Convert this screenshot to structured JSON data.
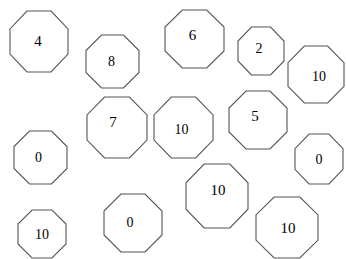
{
  "page": {
    "background_color": "#ffffff",
    "stroke_color": "#555555",
    "text_color": "#000000",
    "width": 346,
    "height": 259,
    "shape_type": "octagon",
    "shape_count": 14
  },
  "shapes": [
    {
      "id": "octagon-4",
      "value": "4",
      "x": 10,
      "y": 11,
      "w": 58,
      "h": 61,
      "font_size": 15,
      "dx": -1,
      "dy": 0
    },
    {
      "id": "octagon-8",
      "value": "8",
      "x": 86,
      "y": 35,
      "w": 53,
      "h": 53,
      "font_size": 14,
      "dx": -1,
      "dy": 0
    },
    {
      "id": "octagon-6",
      "value": "6",
      "x": 165,
      "y": 10,
      "w": 59,
      "h": 58,
      "font_size": 15,
      "dx": -2,
      "dy": -4
    },
    {
      "id": "octagon-2",
      "value": "2",
      "x": 238,
      "y": 27,
      "w": 46,
      "h": 48,
      "font_size": 14,
      "dx": -2,
      "dy": -2
    },
    {
      "id": "octagon-10-topright",
      "value": "10",
      "x": 288,
      "y": 46,
      "w": 56,
      "h": 57,
      "font_size": 14,
      "dx": 3,
      "dy": 2
    },
    {
      "id": "octagon-7",
      "value": "7",
      "x": 87,
      "y": 97,
      "w": 60,
      "h": 61,
      "font_size": 15,
      "dx": -4,
      "dy": -5
    },
    {
      "id": "octagon-10-middle",
      "value": "10",
      "x": 154,
      "y": 97,
      "w": 59,
      "h": 61,
      "font_size": 14,
      "dx": -2,
      "dy": 2
    },
    {
      "id": "octagon-5",
      "value": "5",
      "x": 229,
      "y": 91,
      "w": 58,
      "h": 58,
      "font_size": 15,
      "dx": -3,
      "dy": -4
    },
    {
      "id": "octagon-0-left",
      "value": "0",
      "x": 14,
      "y": 131,
      "w": 53,
      "h": 53,
      "font_size": 14,
      "dx": -2,
      "dy": 0
    },
    {
      "id": "octagon-0-right",
      "value": "0",
      "x": 295,
      "y": 134,
      "w": 48,
      "h": 50,
      "font_size": 14,
      "dx": 0,
      "dy": 1
    },
    {
      "id": "octagon-10-center",
      "value": "10",
      "x": 186,
      "y": 164,
      "w": 62,
      "h": 64,
      "font_size": 15,
      "dx": 1,
      "dy": -6
    },
    {
      "id": "octagon-0-bottom",
      "value": "0",
      "x": 104,
      "y": 194,
      "w": 58,
      "h": 58,
      "font_size": 14,
      "dx": -3,
      "dy": 0
    },
    {
      "id": "octagon-10-botright",
      "value": "10",
      "x": 256,
      "y": 197,
      "w": 62,
      "h": 61,
      "font_size": 15,
      "dx": 1,
      "dy": 1
    },
    {
      "id": "octagon-10-botleft",
      "value": "10",
      "x": 18,
      "y": 210,
      "w": 48,
      "h": 48,
      "font_size": 14,
      "dx": 0,
      "dy": 1
    }
  ]
}
